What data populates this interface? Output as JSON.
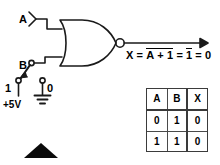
{
  "diagram": {
    "gate": {
      "type": "NOR",
      "name": "nor-gate",
      "inputs": [
        "A",
        "B"
      ],
      "output": "X",
      "has_inversion_bubble": true
    },
    "labels": {
      "input_a": "A",
      "input_b": "B",
      "switch_position_one": "1",
      "switch_position_zero": "0",
      "supply": "+5V"
    },
    "equation": {
      "lhs": "X",
      "equals": "=",
      "term1": "A + 1",
      "term1_overlined": true,
      "term2": "1",
      "term2_overlined": true,
      "result": "0",
      "full_text": "X = A + 1 = 1 = 0"
    },
    "switch": {
      "name": "spdt-switch",
      "selected_position": "1",
      "positions": [
        "1",
        "0"
      ],
      "source_label": "+5V",
      "ground_label": "0"
    },
    "marker": {
      "name": "black-triangle-marker",
      "shape": "triangle-up",
      "color": "#0a0a0a"
    },
    "colors": {
      "ink": "#1a1a1a",
      "table_rule": "#4a4a4a",
      "background": "#ffffff"
    }
  },
  "truth_table": {
    "caption": "NOR truth table with B = 1",
    "headers": [
      "A",
      "B",
      "X"
    ],
    "rows": [
      [
        "0",
        "1",
        "0"
      ],
      [
        "1",
        "1",
        "0"
      ]
    ]
  }
}
